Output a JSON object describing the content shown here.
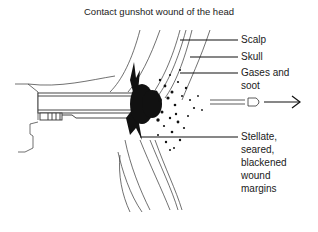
{
  "title": "Contact gunshot wound of the head",
  "labels": {
    "scalp": "Scalp",
    "skull": "Skull",
    "gases_soot_1": "Gases and",
    "gases_soot_2": "soot",
    "wound_1": "Stellate,",
    "wound_2": "seared,",
    "wound_3": "blackened",
    "wound_4": "wound",
    "wound_5": "margins"
  },
  "colors": {
    "ink": "#1a1a1a",
    "background": "#ffffff"
  },
  "icons": {
    "gun": "handgun-muzzle-drawing",
    "bullet": "bullet-glyph",
    "arrow": "right-arrow"
  }
}
